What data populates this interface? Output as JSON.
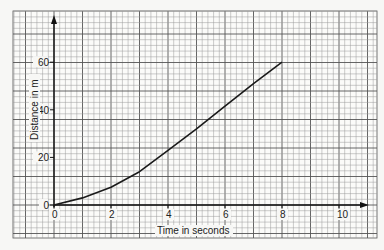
{
  "chart_data": {
    "type": "line",
    "title": "",
    "xlabel": "Time in seconds",
    "ylabel": "Distance in m",
    "xlim": [
      0,
      11
    ],
    "ylim": [
      0,
      65
    ],
    "x_ticks": [
      0,
      2,
      4,
      6,
      8,
      10
    ],
    "y_ticks": [
      0,
      20,
      40,
      60
    ],
    "grid": true,
    "legend": null,
    "series": [
      {
        "name": "distance",
        "x": [
          0,
          1,
          2,
          3,
          4,
          5,
          6,
          7,
          8
        ],
        "values": [
          0,
          3,
          7.5,
          14,
          23,
          32,
          41.5,
          51,
          60
        ]
      }
    ]
  },
  "axes": {
    "x_label": "Time in seconds",
    "y_label": "Distance in m",
    "x_tick_labels": [
      "0",
      "2",
      "4",
      "6",
      "8",
      "10"
    ],
    "y_tick_labels": [
      "0",
      "20",
      "40",
      "60"
    ]
  },
  "colors": {
    "grid_minor": "#9a9a9a",
    "grid_major": "#555555",
    "axis": "#111111",
    "curve": "#1a1a1a",
    "paper": "#f7f7f5"
  }
}
